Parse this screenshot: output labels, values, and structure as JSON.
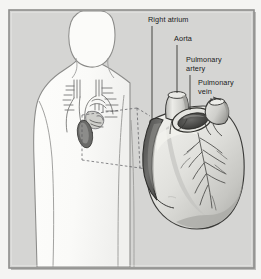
{
  "figure": {
    "kind": "medical-illustration",
    "width": 261,
    "height": 279
  },
  "frame": {
    "background_color": "#d5d5d3",
    "border_color": "#8e8e8c",
    "outer_color": "#f4f4f2",
    "shadow_color": "#b9b9b7"
  },
  "palette": {
    "body_fill": "#fbfbf9",
    "body_outline": "#8a8a88",
    "heart_fill": "#dededa",
    "heart_shade": "#b4b4b0",
    "heart_outline": "#3a3a38",
    "vessel_dark": "#5d5d5b",
    "vessel_darkest": "#3c3c3a",
    "vessel_light": "#e6e6e2",
    "label_color": "#1a1a1a",
    "leader_color": "#2a2a28",
    "callout_color": "#55555a"
  },
  "labels": [
    {
      "id": "right-atrium",
      "text": "Right atrium",
      "text_x": 148,
      "text_y": 22,
      "leader": {
        "x1": 152,
        "y1": 26,
        "x2": 152,
        "y2": 120
      }
    },
    {
      "id": "aorta",
      "text": "Aorta",
      "text_x": 174,
      "text_y": 41,
      "leader": {
        "x1": 177,
        "y1": 45,
        "x2": 177,
        "y2": 106
      }
    },
    {
      "id": "pulmonary-artery",
      "text_line1": "Pulmonary",
      "text_line2": "artery",
      "text_x": 186,
      "text_y": 62,
      "text_y2": 71,
      "leader": {
        "x1": 190,
        "y1": 75,
        "x2": 190,
        "y2": 112
      }
    },
    {
      "id": "pulmonary-vein",
      "text_line1": "Pulmonary",
      "text_line2": "vein",
      "text_x": 198,
      "text_y": 85,
      "text_y2": 94,
      "leader": {
        "x1": 211,
        "y1": 98,
        "x2": 211,
        "y2": 121
      }
    }
  ],
  "annotations": {
    "callout_label": "dashed callout box linking chest detail to enlarged heart",
    "inset_label": "small-scale vessels and heart inside chest"
  }
}
